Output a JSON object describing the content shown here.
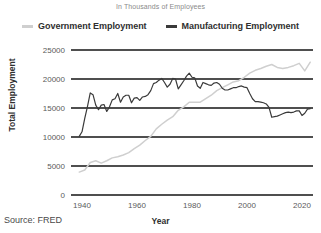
{
  "subtitle": "In Thousands of Employees",
  "source_note": "Source: FRED",
  "legend": {
    "position": "top-center",
    "items": [
      {
        "label": "Government Employment",
        "color": "#cfcfcf",
        "marker": "line-swatch"
      },
      {
        "label": "Manufacturing Employment",
        "color": "#3a3a3a",
        "marker": "line-swatch"
      }
    ]
  },
  "chart_data": {
    "type": "line",
    "title": "",
    "subtitle": "In Thousands of Employees",
    "xlabel": "Year",
    "ylabel": "Total Employment",
    "xlim": [
      1936,
      2024
    ],
    "ylim": [
      0,
      25000
    ],
    "xticks": [
      1940,
      1960,
      1980,
      2000,
      2020
    ],
    "yticks": [
      0,
      5000,
      10000,
      15000,
      20000,
      25000
    ],
    "xticklabels": [
      "1940",
      "1960",
      "1980",
      "2000",
      "2020"
    ],
    "yticklabels": [
      "0",
      "5000",
      "10000",
      "15000",
      "20000",
      "25000"
    ],
    "grid": "horizontal",
    "legend_position": "top-center",
    "series": [
      {
        "name": "Government Employment",
        "color": "#cfcfcf",
        "x": [
          1939,
          1941,
          1943,
          1945,
          1947,
          1949,
          1951,
          1953,
          1955,
          1957,
          1959,
          1961,
          1963,
          1965,
          1967,
          1969,
          1971,
          1973,
          1975,
          1977,
          1979,
          1981,
          1983,
          1985,
          1987,
          1989,
          1991,
          1993,
          1995,
          1997,
          1999,
          2001,
          2003,
          2005,
          2007,
          2009,
          2011,
          2013,
          2015,
          2017,
          2019,
          2021,
          2023
        ],
        "values": [
          3950,
          4300,
          5600,
          5900,
          5500,
          5900,
          6400,
          6600,
          6900,
          7300,
          8000,
          8600,
          9400,
          10100,
          11400,
          12200,
          12900,
          13500,
          14600,
          15200,
          16000,
          16000,
          16000,
          16600,
          17200,
          18000,
          18500,
          19000,
          19500,
          19700,
          20300,
          21000,
          21500,
          21800,
          22200,
          22500,
          22000,
          21800,
          22000,
          22300,
          22700,
          21400,
          22900
        ],
        "endpoint_value": 22900
      },
      {
        "name": "Manufacturing Employment",
        "color": "#3a3a3a",
        "x": [
          1939,
          1940,
          1941,
          1942,
          1943,
          1944,
          1945,
          1946,
          1947,
          1948,
          1949,
          1950,
          1951,
          1952,
          1953,
          1954,
          1955,
          1956,
          1957,
          1958,
          1959,
          1960,
          1961,
          1962,
          1963,
          1964,
          1965,
          1966,
          1967,
          1968,
          1969,
          1970,
          1971,
          1972,
          1973,
          1974,
          1975,
          1976,
          1977,
          1978,
          1979,
          1980,
          1981,
          1982,
          1983,
          1984,
          1985,
          1986,
          1987,
          1988,
          1989,
          1990,
          1991,
          1992,
          1993,
          1994,
          1995,
          1996,
          1997,
          1998,
          1999,
          2000,
          2001,
          2002,
          2003,
          2004,
          2005,
          2006,
          2007,
          2008,
          2009,
          2010,
          2011,
          2012,
          2013,
          2014,
          2015,
          2016,
          2017,
          2018,
          2019,
          2020,
          2021,
          2022,
          2023
        ],
        "values": [
          10100,
          10900,
          13200,
          15300,
          17600,
          17300,
          15500,
          14700,
          15500,
          15600,
          14400,
          15200,
          16400,
          16600,
          17500,
          16000,
          16900,
          17200,
          17200,
          15900,
          16700,
          16800,
          16300,
          16900,
          17000,
          17300,
          18000,
          19200,
          19400,
          19800,
          20100,
          19400,
          18600,
          19100,
          20100,
          20000,
          18300,
          19000,
          19700,
          20500,
          21000,
          20300,
          20200,
          18800,
          18400,
          19400,
          19200,
          19000,
          18900,
          19300,
          19400,
          19100,
          18400,
          18100,
          18100,
          18300,
          18500,
          18500,
          18700,
          18800,
          18600,
          18500,
          17500,
          16600,
          16100,
          16100,
          16000,
          15900,
          15700,
          15100,
          13400,
          13500,
          13600,
          13800,
          14000,
          14200,
          14300,
          14200,
          14300,
          14500,
          14500,
          13700,
          14100,
          14800,
          14900
        ],
        "endpoint_value": 14900
      }
    ]
  }
}
